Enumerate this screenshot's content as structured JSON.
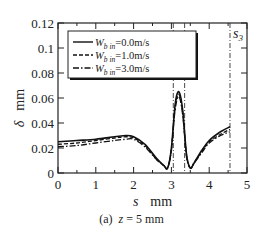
{
  "caption": {
    "label": "(a)",
    "variable": "z",
    "value": " = 5 mm"
  },
  "chart_data": {
    "type": "line",
    "title": "",
    "xlabel": "s    mm",
    "ylabel": "δ    mm",
    "xlim": [
      0,
      5
    ],
    "ylim": [
      0,
      0.12
    ],
    "xticks": [
      0,
      1,
      2,
      3,
      4,
      5
    ],
    "yticks": [
      0,
      0.02,
      0.04,
      0.06,
      0.08,
      0.1,
      0.12
    ],
    "ytick_labels": [
      "0",
      "0.02",
      "0.04",
      "0.06",
      "0.08",
      "0.1",
      "0.12"
    ],
    "grid": false,
    "legend_position": "upper left",
    "vlines": [
      {
        "label": "s1",
        "x": 3.05
      },
      {
        "label": "s2",
        "x": 3.35
      },
      {
        "label": "s3",
        "x": 4.55
      }
    ],
    "x": [
      0,
      0.5,
      1.0,
      1.5,
      1.8,
      2.0,
      2.3,
      2.6,
      2.8,
      2.9,
      3.0,
      3.1,
      3.2,
      3.3,
      3.4,
      3.5,
      3.6,
      3.8,
      4.0,
      4.3,
      4.55
    ],
    "series": [
      {
        "name": "W_b in=0.0m/s",
        "style": "solid",
        "values": [
          0.025,
          0.026,
          0.027,
          0.029,
          0.03,
          0.029,
          0.023,
          0.012,
          0.006,
          0.004,
          0.02,
          0.055,
          0.065,
          0.05,
          0.015,
          0.004,
          0.008,
          0.018,
          0.026,
          0.033,
          0.037
        ]
      },
      {
        "name": "W_b in=1.0m/s",
        "style": "dashed",
        "values": [
          0.023,
          0.024,
          0.026,
          0.028,
          0.029,
          0.028,
          0.022,
          0.011,
          0.006,
          0.004,
          0.019,
          0.053,
          0.063,
          0.048,
          0.014,
          0.004,
          0.008,
          0.017,
          0.025,
          0.031,
          0.035
        ]
      },
      {
        "name": "W_b in=3.0m/s",
        "style": "dashdot",
        "values": [
          0.021,
          0.022,
          0.024,
          0.026,
          0.027,
          0.027,
          0.021,
          0.011,
          0.006,
          0.004,
          0.018,
          0.051,
          0.061,
          0.046,
          0.013,
          0.004,
          0.008,
          0.016,
          0.024,
          0.03,
          0.033
        ]
      }
    ]
  },
  "legend": {
    "items": [
      {
        "prefix": "W",
        "sub": "b in",
        "value": "=0.0m/s"
      },
      {
        "prefix": "W",
        "sub": "b in",
        "value": "=1.0m/s"
      },
      {
        "prefix": "W",
        "sub": "b in",
        "value": "=3.0m/s"
      }
    ]
  },
  "axes": {
    "x_symbol": "s",
    "x_unit": "mm",
    "y_symbol": "δ",
    "y_unit": "mm"
  }
}
